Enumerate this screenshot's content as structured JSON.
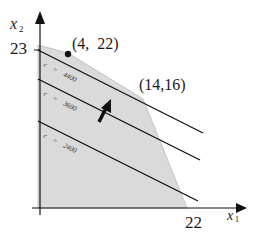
{
  "diagram": {
    "type": "linear-programming-feasible-region",
    "axes": {
      "x_label": "x",
      "x_sub": "1",
      "y_label": "x",
      "y_sub": "2"
    },
    "tick_labels": {
      "y_intercept": "23",
      "x_intercept": "22"
    },
    "vertices": [
      {
        "label": "(4,  22)",
        "x": 4,
        "y": 22
      },
      {
        "label": "(14,16)",
        "x": 14,
        "y": 16
      }
    ],
    "objective_lines": [
      {
        "label": "c = 4400",
        "c_text": "c",
        "eq_text": "=",
        "value_text": "4400",
        "value": 4400
      },
      {
        "label": "c = 3600",
        "c_text": "c",
        "eq_text": "=",
        "value_text": "3600",
        "value": 3600
      },
      {
        "label": "c = 2400",
        "c_text": "c",
        "eq_text": "=",
        "value_text": "2400",
        "value": 2400
      }
    ],
    "colors": {
      "region_fill": "#d9d9d9",
      "region_edge": "#bfbfbf",
      "line": "#111111",
      "axis": "#111111"
    },
    "direction_arrow": "increasing-c"
  }
}
